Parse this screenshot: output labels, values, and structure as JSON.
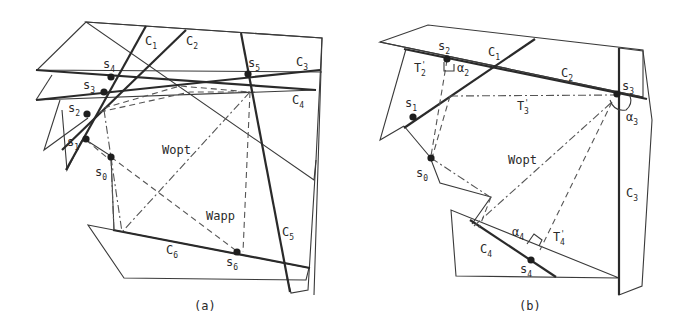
{
  "panel_a": {
    "caption": "(a)",
    "region_labels": [
      {
        "base": "C",
        "sub": "1"
      },
      {
        "base": "C",
        "sub": "2"
      },
      {
        "base": "C",
        "sub": "3"
      },
      {
        "base": "C",
        "sub": "4"
      },
      {
        "base": "C",
        "sub": "5"
      },
      {
        "base": "C",
        "sub": "6"
      }
    ],
    "points": [
      {
        "base": "s",
        "sub": "0"
      },
      {
        "base": "s",
        "sub": "1"
      },
      {
        "base": "s",
        "sub": "2"
      },
      {
        "base": "s",
        "sub": "3"
      },
      {
        "base": "s",
        "sub": "4"
      },
      {
        "base": "s",
        "sub": "5"
      },
      {
        "base": "s",
        "sub": "6"
      }
    ],
    "path_labels": {
      "optimal": "Wopt",
      "approx": "Wapp"
    }
  },
  "panel_b": {
    "caption": "(b)",
    "region_labels": [
      {
        "base": "C",
        "sub": "1"
      },
      {
        "base": "C",
        "sub": "2"
      },
      {
        "base": "C",
        "sub": "3"
      },
      {
        "base": "C",
        "sub": "4"
      }
    ],
    "points": [
      {
        "base": "s",
        "sub": "0"
      },
      {
        "base": "s",
        "sub": "1"
      },
      {
        "base": "s",
        "sub": "2"
      },
      {
        "base": "s",
        "sub": "3"
      },
      {
        "base": "s",
        "sub": "4"
      }
    ],
    "angle_labels": [
      {
        "base": "α",
        "sub": "2"
      },
      {
        "base": "α",
        "sub": "3"
      },
      {
        "base": "α",
        "sub": "4"
      }
    ],
    "segment_labels": [
      {
        "base": "T",
        "sup": "'",
        "sub": "2"
      },
      {
        "base": "T",
        "sup": "'",
        "sub": "3"
      },
      {
        "base": "T",
        "sup": "'",
        "sub": "4"
      }
    ],
    "path_labels": {
      "optimal": "Wopt"
    }
  }
}
